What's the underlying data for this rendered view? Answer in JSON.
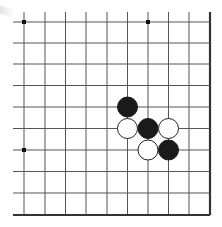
{
  "board": {
    "type": "go-board-fragment",
    "visible_columns": 10,
    "visible_rows": 10,
    "edges": [
      "right",
      "bottom"
    ],
    "line_color": "#555555",
    "edge_color": "#333333",
    "star_points": [
      {
        "col": 0,
        "row": 0
      },
      {
        "col": 6,
        "row": 0
      },
      {
        "col": 0,
        "row": 6
      }
    ],
    "stones": [
      {
        "color": "black",
        "col": 5,
        "row": 4
      },
      {
        "color": "white",
        "col": 5,
        "row": 5
      },
      {
        "color": "black",
        "col": 6,
        "row": 5
      },
      {
        "color": "white",
        "col": 7,
        "row": 5
      },
      {
        "color": "white",
        "col": 6,
        "row": 6
      },
      {
        "color": "black",
        "col": 7,
        "row": 6
      }
    ],
    "colors": {
      "black_stone": "#1a1a1a",
      "white_stone": "#ffffff",
      "white_stone_outline": "#222222"
    }
  }
}
